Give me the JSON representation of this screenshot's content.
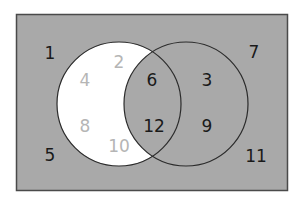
{
  "diagram": {
    "type": "venn",
    "universe": {
      "fill": "#a9a9a9",
      "border": "#4a4a4a",
      "x": 16,
      "y": 14,
      "width": 272,
      "height": 177
    },
    "sets": [
      {
        "name": "A",
        "cx": 119,
        "cy": 104,
        "r": 62,
        "shading": "only-A unshaded (white)"
      },
      {
        "name": "B",
        "cx": 186,
        "cy": 104,
        "r": 62,
        "shading": "shaded"
      }
    ],
    "colors": {
      "shaded": "#a9a9a9",
      "unshaded": "#ffffff",
      "outline": "#2b2b2b",
      "label_dark": "#1a1a1a",
      "label_light": "#b5b5b5"
    },
    "regions": {
      "outside": [
        "1",
        "7",
        "5",
        "11"
      ],
      "only_A": [
        "2",
        "4",
        "8",
        "10"
      ],
      "A_and_B": [
        "6",
        "12"
      ],
      "only_B": [
        "3",
        "9"
      ]
    },
    "labels": [
      {
        "text": "1",
        "x": 50,
        "y": 53,
        "tone": "dark"
      },
      {
        "text": "2",
        "x": 119,
        "y": 62,
        "tone": "light"
      },
      {
        "text": "4",
        "x": 85,
        "y": 80,
        "tone": "light"
      },
      {
        "text": "6",
        "x": 152,
        "y": 80,
        "tone": "dark"
      },
      {
        "text": "3",
        "x": 207,
        "y": 80,
        "tone": "dark"
      },
      {
        "text": "7",
        "x": 254,
        "y": 52,
        "tone": "dark"
      },
      {
        "text": "8",
        "x": 85,
        "y": 126,
        "tone": "light"
      },
      {
        "text": "12",
        "x": 154,
        "y": 126,
        "tone": "dark"
      },
      {
        "text": "9",
        "x": 207,
        "y": 126,
        "tone": "dark"
      },
      {
        "text": "10",
        "x": 119,
        "y": 146,
        "tone": "light"
      },
      {
        "text": "5",
        "x": 50,
        "y": 155,
        "tone": "dark"
      },
      {
        "text": "11",
        "x": 256,
        "y": 156,
        "tone": "dark"
      }
    ]
  }
}
